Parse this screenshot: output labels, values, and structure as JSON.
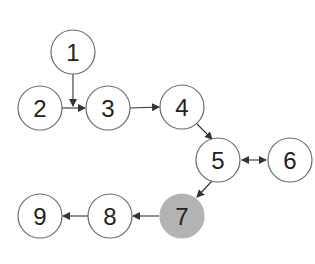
{
  "diagram": {
    "type": "directed-graph",
    "nodes": [
      {
        "id": "1",
        "label": "1",
        "x": 73,
        "y": 52,
        "highlighted": false
      },
      {
        "id": "2",
        "label": "2",
        "x": 40,
        "y": 108,
        "highlighted": false
      },
      {
        "id": "3",
        "label": "3",
        "x": 108,
        "y": 108,
        "highlighted": false
      },
      {
        "id": "4",
        "label": "4",
        "x": 182,
        "y": 107,
        "highlighted": false
      },
      {
        "id": "5",
        "label": "5",
        "x": 218,
        "y": 160,
        "highlighted": false
      },
      {
        "id": "6",
        "label": "6",
        "x": 290,
        "y": 160,
        "highlighted": false
      },
      {
        "id": "7",
        "label": "7",
        "x": 182,
        "y": 216,
        "highlighted": true
      },
      {
        "id": "8",
        "label": "8",
        "x": 110,
        "y": 216,
        "highlighted": false
      },
      {
        "id": "9",
        "label": "9",
        "x": 40,
        "y": 216,
        "highlighted": false
      }
    ],
    "edges": [
      {
        "from": "1",
        "to": "2-3-edge",
        "direction": "forward"
      },
      {
        "from": "2",
        "to": "3",
        "direction": "forward"
      },
      {
        "from": "3",
        "to": "4",
        "direction": "forward"
      },
      {
        "from": "4",
        "to": "5",
        "direction": "forward"
      },
      {
        "from": "5",
        "to": "6",
        "direction": "bidirectional"
      },
      {
        "from": "5",
        "to": "7",
        "direction": "forward"
      },
      {
        "from": "7",
        "to": "8",
        "direction": "forward"
      },
      {
        "from": "8",
        "to": "9",
        "direction": "forward"
      }
    ],
    "colors": {
      "node_stroke": "#6b6b6b",
      "highlight_fill": "#b3b3b3",
      "edge": "#333333"
    }
  }
}
